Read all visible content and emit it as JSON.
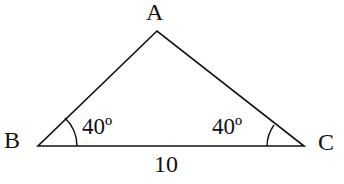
{
  "diagram": {
    "type": "triangle",
    "vertices": [
      {
        "name": "A",
        "label": "A"
      },
      {
        "name": "B",
        "label": "B"
      },
      {
        "name": "C",
        "label": "C"
      }
    ],
    "angles": {
      "B": "40º",
      "C": "40º"
    },
    "sides": {
      "BC": "10"
    },
    "colors": {
      "stroke": "#111111",
      "background": "#ffffff"
    }
  }
}
